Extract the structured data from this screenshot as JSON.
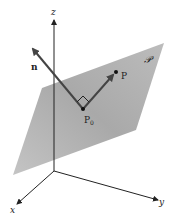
{
  "diagram": {
    "labels": {
      "z_axis": "z",
      "x_axis": "x",
      "y_axis": "y",
      "normal": "n",
      "point": "P",
      "base_point": "P",
      "base_point_subscript": "0",
      "plane": "𝒫"
    },
    "colors": {
      "plane_fill": "#b8b8b8",
      "axis": "#222222",
      "vector": "#444444",
      "background": "#ffffff"
    }
  }
}
